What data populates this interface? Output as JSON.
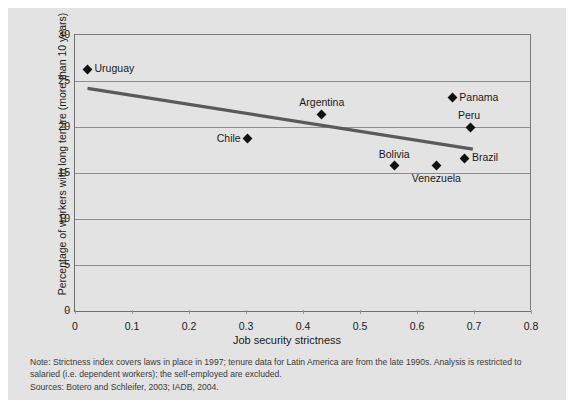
{
  "chart_data": {
    "type": "scatter",
    "title": "",
    "xlabel": "Job security strictness",
    "ylabel": "Percentage of workers with long tenure (more than 10 years)",
    "xlim": [
      0,
      0.8
    ],
    "ylim": [
      0,
      30
    ],
    "xticks": [
      "0",
      "0.1",
      "0.2",
      "0.3",
      "0.4",
      "0.5",
      "0.6",
      "0.7",
      "0.8"
    ],
    "xtick_values": [
      0,
      0.1,
      0.2,
      0.3,
      0.4,
      0.5,
      0.6,
      0.7,
      0.8
    ],
    "yticks": [
      "0",
      "5",
      "10",
      "15",
      "20",
      "25",
      "30"
    ],
    "ytick_values": [
      0,
      5,
      10,
      15,
      20,
      25,
      30
    ],
    "grid": "horizontal",
    "legend": "none",
    "marker_color": "#111111",
    "trendline_color": "#5a5a5a",
    "points": [
      {
        "label": "Uruguay",
        "x": 0.022,
        "y": 26.3,
        "label_pos": "right"
      },
      {
        "label": "Chile",
        "x": 0.303,
        "y": 18.7,
        "label_pos": "left"
      },
      {
        "label": "Argentina",
        "x": 0.433,
        "y": 21.4,
        "label_pos": "above"
      },
      {
        "label": "Bolivia",
        "x": 0.56,
        "y": 15.8,
        "label_pos": "above"
      },
      {
        "label": "Venezuela",
        "x": 0.634,
        "y": 15.8,
        "label_pos": "below"
      },
      {
        "label": "Panama",
        "x": 0.662,
        "y": 23.2,
        "label_pos": "right"
      },
      {
        "label": "Peru",
        "x": 0.693,
        "y": 20.0,
        "label_pos": "aboveright"
      },
      {
        "label": "Brazil",
        "x": 0.684,
        "y": 16.6,
        "label_pos": "right"
      }
    ],
    "trendline": {
      "x0": 0.022,
      "y0": 24.2,
      "x1": 0.698,
      "y1": 17.6
    }
  },
  "notes": {
    "note": "Note: Strictness index covers laws in place in 1997; tenure data for Latin America are from the late 1990s. Analysis is restricted to salaried (i.e. dependent workers); the self-employed are excluded.",
    "sources": "Sources: Botero and Schleifer, 2003; IADB, 2004."
  }
}
